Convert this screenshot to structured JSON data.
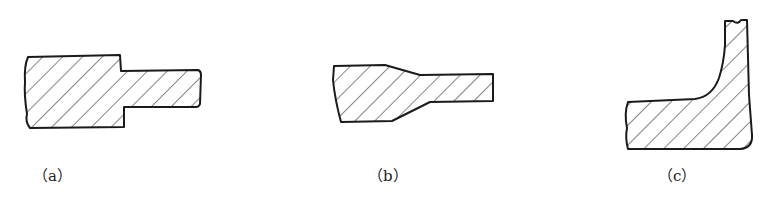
{
  "figure": {
    "stroke_color": "#1a1a1a",
    "hatch_color": "#333333",
    "background": "#ffffff",
    "panels": [
      {
        "id": "a",
        "label": "（a）",
        "shape": "stepped-shaft"
      },
      {
        "id": "b",
        "label": "（b）",
        "shape": "tapered-shaft"
      },
      {
        "id": "c",
        "label": "（c）",
        "shape": "L-flange-with-fillet"
      }
    ]
  }
}
